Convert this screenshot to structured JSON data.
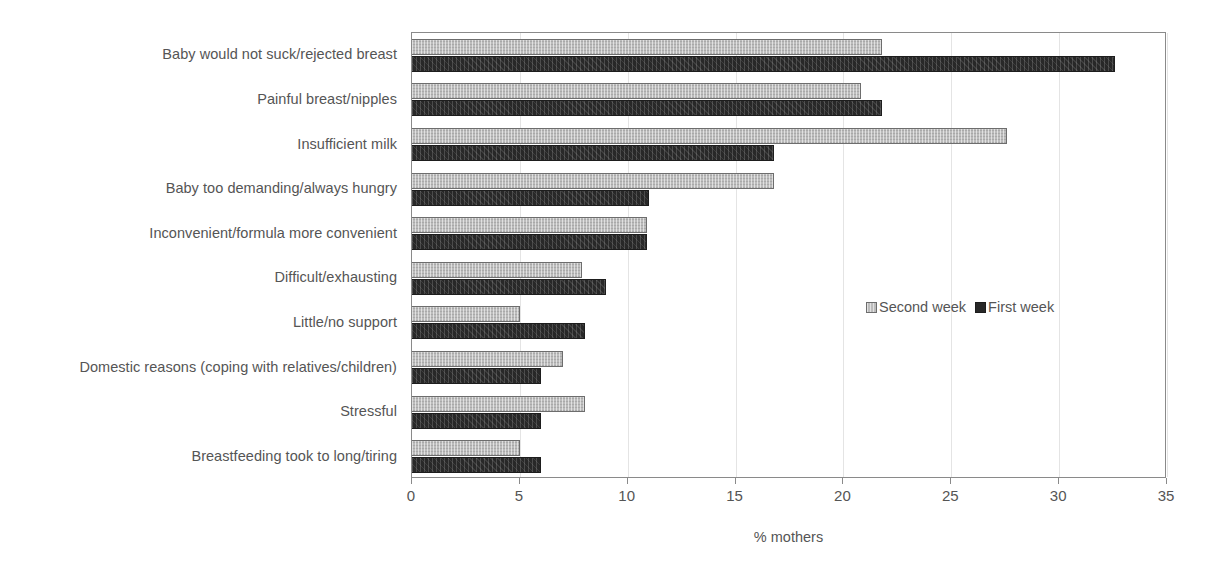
{
  "chart_data": {
    "type": "bar",
    "orientation": "horizontal",
    "title": "",
    "xlabel": "% mothers",
    "ylabel": "",
    "xlim": [
      0,
      35
    ],
    "xticks": [
      0,
      5,
      10,
      15,
      20,
      25,
      30,
      35
    ],
    "xtick_labels": [
      "0",
      "5",
      "10",
      "15",
      "20",
      "25",
      "30",
      "35"
    ],
    "grid": "vertical",
    "legend_position": "center-right inside plot",
    "categories": [
      "Baby would not suck/rejected breast",
      "Painful breast/nipples",
      "Insufficient milk",
      "Baby too demanding/always hungry",
      "Inconvenient/formula more convenient",
      "Difficult/exhausting",
      "Little/no support",
      "Domestic reasons (coping with relatives/children)",
      "Stressful",
      "Breastfeeding took to long/tiring"
    ],
    "series": [
      {
        "name": "Second week",
        "color": "#bcbcbc",
        "values": [
          21.8,
          20.8,
          27.6,
          16.8,
          10.9,
          7.9,
          5.0,
          7.0,
          8.0,
          5.0
        ]
      },
      {
        "name": "First week",
        "color": "#282828",
        "values": [
          32.6,
          21.8,
          16.8,
          11.0,
          10.9,
          9.0,
          8.0,
          6.0,
          6.0,
          6.0
        ]
      }
    ]
  },
  "legend": {
    "entries": [
      {
        "label": "Second week",
        "swatch": "second"
      },
      {
        "label": "First week",
        "swatch": "first"
      }
    ]
  }
}
